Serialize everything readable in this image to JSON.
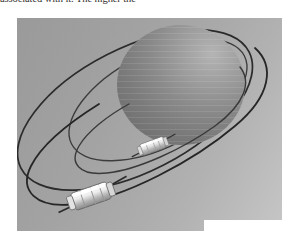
{
  "document": {
    "body_text_fragment": "associated with it. The higher the",
    "page_background": "#ffffff",
    "text_color": "#35312e"
  },
  "figure": {
    "caption": "",
    "alt_description": "Grayscale 3D rendering of a planet sphere encircled by two elliptical satellite orbits, each carrying a small cylindrical satellite",
    "background": {
      "type": "linear-gradient",
      "angle_deg": 118,
      "from_color": "#9a9a9a",
      "to_color": "#c6c6c6"
    },
    "planet": {
      "name": "planet-sphere",
      "center_x": 181,
      "center_y": 85,
      "radius_x": 64,
      "radius_y": 60,
      "shade_dark": "#6f6f6f",
      "shade_mid": "#808080",
      "shade_light": "#a9a9a9",
      "terminator_color": "#7a7a7a"
    },
    "orbits": [
      {
        "name": "outer-orbit",
        "label": "outer orbital path",
        "stroke_color": "#2a2a2a",
        "stroke_width": 1.6,
        "center_x": 132,
        "center_y": 108,
        "radius_x": 128,
        "radius_y": 62,
        "rotation_deg": -27
      },
      {
        "name": "inner-orbit",
        "label": "inner orbital path",
        "stroke_color": "#3a3a3a",
        "stroke_width": 1.3,
        "center_x": 160,
        "center_y": 98,
        "radius_x": 98,
        "radius_y": 47,
        "rotation_deg": -27
      }
    ],
    "satellites": [
      {
        "name": "satellite-inner",
        "label": "inner satellite",
        "x": 153,
        "y": 147,
        "scale": 0.72,
        "body_color": "#efefef",
        "shade_color": "#a8a8a8",
        "antenna_color": "#3a3a3a"
      },
      {
        "name": "satellite-outer",
        "label": "outer satellite",
        "x": 91,
        "y": 197,
        "scale": 1.0,
        "body_color": "#f4f4f4",
        "shade_color": "#9f9f9f",
        "antenna_color": "#3a3a3a"
      }
    ]
  }
}
